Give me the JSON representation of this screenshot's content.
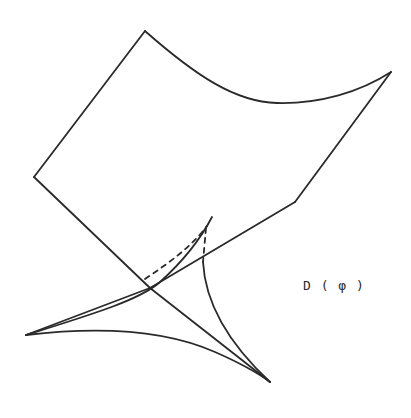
{
  "diagram": {
    "type": "surface-singularity-sketch",
    "label": "D(φ)",
    "label_display": "D ( φ )",
    "stroke_color": "#2a2a2a",
    "background": "#ffffff",
    "elements": {
      "sheet": "curved quadrilateral surface patch",
      "cusp_region": "swallowtail-like cusp with three cusp points",
      "hidden_edges": "dashed lines indicating occluded curves"
    }
  }
}
